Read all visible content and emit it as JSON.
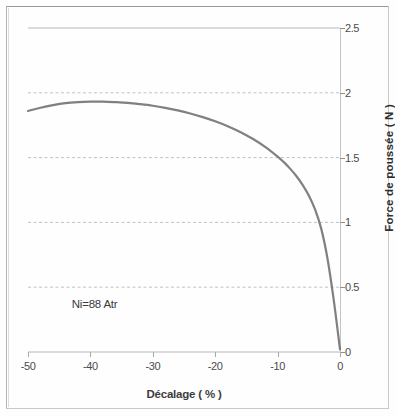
{
  "figure": {
    "background_color": "#fefefe",
    "frame_color": "#c9c9c9"
  },
  "annotation": {
    "text": "Ni=88 Atr"
  },
  "axis_titles": {
    "x": "Décalage ( % )",
    "y": "Force de poussée ( N )"
  },
  "chart_data": {
    "type": "line",
    "title": "",
    "subtitle": "",
    "xlabel": "Décalage ( % )",
    "ylabel": "Force de poussée ( N )",
    "xlim": [
      -50,
      0
    ],
    "ylim": [
      0,
      2.5
    ],
    "xticks": [
      -50,
      -40,
      -30,
      -20,
      -10,
      0
    ],
    "xticklabels": [
      "-50",
      "-40",
      "-30",
      "-20",
      "-10",
      "0"
    ],
    "yticks": [
      0,
      0.5,
      1,
      1.5,
      2,
      2.5
    ],
    "yticklabels": [
      "0",
      "0.5",
      "1",
      "1.5",
      "2",
      "2.5"
    ],
    "y_axis_position": "right",
    "grid": true,
    "grid_axis": "y",
    "grid_style": "dashed",
    "grid_color": "#c2c2c2",
    "legend": false,
    "legend_position": "none",
    "annotations": [
      {
        "text": "Ni=88 Atr",
        "x": -43,
        "y": 0.36
      }
    ],
    "series": [
      {
        "name": "Force de poussée",
        "color": "#6e6e6e",
        "line_width": 2.2,
        "marker": "none",
        "x": [
          -50,
          -48,
          -46,
          -44,
          -42,
          -40,
          -38,
          -36,
          -34,
          -32,
          -30,
          -28,
          -26,
          -24,
          -22,
          -20,
          -18,
          -16,
          -14,
          -12,
          -10,
          -9,
          -8,
          -7,
          -6,
          -5,
          -4,
          -3,
          -2,
          -1,
          0
        ],
        "values": [
          1.86,
          1.885,
          1.905,
          1.92,
          1.928,
          1.932,
          1.932,
          1.928,
          1.922,
          1.912,
          1.9,
          1.884,
          1.864,
          1.84,
          1.812,
          1.78,
          1.742,
          1.698,
          1.645,
          1.583,
          1.508,
          1.465,
          1.415,
          1.358,
          1.29,
          1.208,
          1.1,
          0.95,
          0.72,
          0.4,
          0.02
        ]
      }
    ]
  }
}
